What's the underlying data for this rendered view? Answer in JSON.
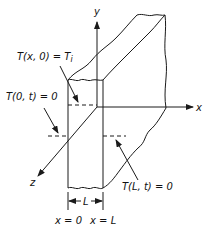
{
  "diagram": {
    "type": "slab-heat-conduction",
    "axes": {
      "x_label": "x",
      "y_label": "y",
      "z_label": "z"
    },
    "annotations": {
      "initial_condition": "T(x, 0) = T",
      "initial_condition_subscript": "i",
      "left_boundary": "T(0, t) = 0",
      "right_boundary": "T(L, t) = 0",
      "thickness": "L",
      "left_face": "x = 0",
      "right_face": "x = L"
    }
  }
}
